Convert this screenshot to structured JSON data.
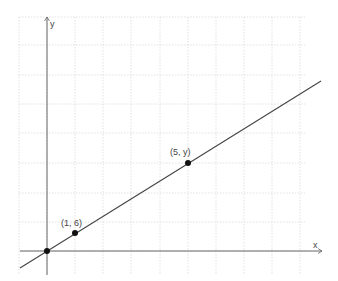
{
  "diagram": {
    "title": "",
    "axes": {
      "x_label": "x",
      "y_label": "y",
      "origin_px": [
        47,
        251
      ],
      "x_axis_px": {
        "from": 20,
        "to": 322,
        "y": 251
      },
      "y_axis_px": {
        "x": 47,
        "from": 275,
        "to": 17
      }
    },
    "grid": {
      "style": "dotted",
      "color": "#d9d9d9",
      "vertical_px": [
        19,
        47,
        75,
        103,
        131,
        160,
        188,
        216,
        244,
        272,
        300
      ],
      "horizontal_px": [
        17,
        45,
        75,
        104,
        133,
        163,
        193,
        222,
        251
      ],
      "top": 17,
      "bottom": 275,
      "left": 19,
      "right": 305
    },
    "line": {
      "from_px": [
        20,
        268
      ],
      "to_px": [
        321,
        81
      ],
      "color": "#444444"
    },
    "points": [
      {
        "label": "",
        "px": [
          47,
          251
        ],
        "label_px": null
      },
      {
        "label": "(1, 6)",
        "px": [
          75,
          233
        ],
        "label_px": [
          61,
          226
        ]
      },
      {
        "label": "(5, y)",
        "px": [
          188,
          163
        ],
        "label_px": [
          170,
          155
        ]
      }
    ],
    "colors": {
      "axis": "#666666",
      "point": "#111111",
      "text": "#444444"
    }
  },
  "chart_data": {
    "type": "line",
    "title": "",
    "xlabel": "x",
    "ylabel": "y",
    "series": [
      {
        "name": "line through origin",
        "points": [
          [
            0,
            0
          ],
          [
            1,
            6
          ],
          [
            5,
            "y"
          ]
        ]
      }
    ],
    "annotations": [
      "(1, 6)",
      "(5, y)"
    ],
    "grid": true
  }
}
